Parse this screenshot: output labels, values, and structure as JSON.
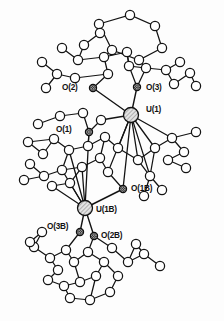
{
  "figure": {
    "kind": "crystal-structure-diagram",
    "style": "ball-and-stick ORTEP thermal ellipsoid plot",
    "background_color": "#fdfdfd",
    "bond_color": "#111111",
    "carbon_atom_fill": "#ffffff",
    "oxygen_atom_fill": "#3a3a3a",
    "metal_atom_fill": "#d9d9d9"
  },
  "labels": [
    {
      "id": "o2",
      "text": "O(2)",
      "x": 62,
      "y": 84,
      "atom_x": 93,
      "atom_y": 88
    },
    {
      "id": "o3",
      "text": "O(3)",
      "x": 146,
      "y": 84,
      "atom_x": 137,
      "atom_y": 87
    },
    {
      "id": "u1",
      "text": "U(1)",
      "x": 146,
      "y": 106,
      "atom_x": 131,
      "atom_y": 115
    },
    {
      "id": "o1",
      "text": "O(1)",
      "x": 56,
      "y": 126,
      "atom_x": 89,
      "atom_y": 132
    },
    {
      "id": "o1b",
      "text": "O(1B)",
      "x": 131,
      "y": 185,
      "atom_x": 123,
      "atom_y": 189
    },
    {
      "id": "u1b",
      "text": "U(1B)",
      "x": 96,
      "y": 206,
      "atom_x": 85,
      "atom_y": 208
    },
    {
      "id": "o3b",
      "text": "O(3B)",
      "x": 47,
      "y": 223,
      "atom_x": 80,
      "atom_y": 232
    },
    {
      "id": "o2b",
      "text": "O(2B)",
      "x": 101,
      "y": 232,
      "atom_x": 94,
      "atom_y": 236
    }
  ],
  "atoms": {
    "metal": [
      {
        "name": "U(1)",
        "x": 131,
        "y": 115,
        "r": 7.5
      },
      {
        "name": "U(1B)",
        "x": 85,
        "y": 208,
        "r": 7.5
      }
    ],
    "oxygen_labeled": [
      {
        "name": "O(2)",
        "x": 93,
        "y": 88,
        "r": 3.6
      },
      {
        "name": "O(3)",
        "x": 137,
        "y": 87,
        "r": 3.6
      },
      {
        "name": "O(1)",
        "x": 89,
        "y": 132,
        "r": 3.6
      },
      {
        "name": "O(1B)",
        "x": 123,
        "y": 189,
        "r": 3.6
      },
      {
        "name": "O(3B)",
        "x": 80,
        "y": 232,
        "r": 3.6
      },
      {
        "name": "O(2B)",
        "x": 94,
        "y": 236,
        "r": 3.6
      }
    ],
    "light": [
      {
        "x": 99,
        "y": 24,
        "r": 4.6
      },
      {
        "x": 130,
        "y": 15,
        "r": 4.6
      },
      {
        "x": 155,
        "y": 26,
        "r": 4.6
      },
      {
        "x": 162,
        "y": 48,
        "r": 4.6
      },
      {
        "x": 139,
        "y": 60,
        "r": 4.6
      },
      {
        "x": 112,
        "y": 50,
        "r": 4.6
      },
      {
        "x": 84,
        "y": 45,
        "r": 4.6
      },
      {
        "x": 100,
        "y": 33,
        "r": 4.6
      },
      {
        "x": 78,
        "y": 60,
        "r": 4.6
      },
      {
        "x": 62,
        "y": 48,
        "r": 4.6
      },
      {
        "x": 104,
        "y": 57,
        "r": 4.6
      },
      {
        "x": 127,
        "y": 52,
        "r": 4.6
      },
      {
        "x": 146,
        "y": 68,
        "r": 4.6
      },
      {
        "x": 166,
        "y": 70,
        "r": 4.6
      },
      {
        "x": 180,
        "y": 62,
        "r": 4.6
      },
      {
        "x": 190,
        "y": 73,
        "r": 4.6
      },
      {
        "x": 174,
        "y": 84,
        "r": 4.6
      },
      {
        "x": 196,
        "y": 86,
        "r": 4.6
      },
      {
        "x": 57,
        "y": 74,
        "r": 4.6
      },
      {
        "x": 42,
        "y": 62,
        "r": 4.6
      },
      {
        "x": 46,
        "y": 88,
        "r": 4.6
      },
      {
        "x": 75,
        "y": 78,
        "r": 4.6
      },
      {
        "x": 108,
        "y": 74,
        "r": 4.6
      },
      {
        "x": 129,
        "y": 66,
        "r": 4.6
      },
      {
        "x": 101,
        "y": 120,
        "r": 4.6
      },
      {
        "x": 83,
        "y": 113,
        "r": 4.6
      },
      {
        "x": 60,
        "y": 116,
        "r": 4.6
      },
      {
        "x": 38,
        "y": 124,
        "r": 4.6
      },
      {
        "x": 28,
        "y": 142,
        "r": 4.6
      },
      {
        "x": 43,
        "y": 154,
        "r": 4.6
      },
      {
        "x": 54,
        "y": 139,
        "r": 4.6
      },
      {
        "x": 69,
        "y": 150,
        "r": 4.6
      },
      {
        "x": 88,
        "y": 146,
        "r": 4.6
      },
      {
        "x": 105,
        "y": 137,
        "r": 4.6
      },
      {
        "x": 118,
        "y": 148,
        "r": 4.6
      },
      {
        "x": 100,
        "y": 158,
        "r": 4.6
      },
      {
        "x": 82,
        "y": 167,
        "r": 4.6
      },
      {
        "x": 62,
        "y": 170,
        "r": 4.6
      },
      {
        "x": 44,
        "y": 176,
        "r": 4.6
      },
      {
        "x": 30,
        "y": 164,
        "r": 4.6
      },
      {
        "x": 24,
        "y": 180,
        "r": 4.6
      },
      {
        "x": 52,
        "y": 186,
        "r": 4.6
      },
      {
        "x": 70,
        "y": 183,
        "r": 4.6
      },
      {
        "x": 108,
        "y": 172,
        "r": 4.6
      },
      {
        "x": 138,
        "y": 160,
        "r": 4.6
      },
      {
        "x": 155,
        "y": 148,
        "r": 4.6
      },
      {
        "x": 172,
        "y": 138,
        "r": 4.6
      },
      {
        "x": 184,
        "y": 152,
        "r": 4.6
      },
      {
        "x": 168,
        "y": 160,
        "r": 4.6
      },
      {
        "x": 186,
        "y": 168,
        "r": 4.6
      },
      {
        "x": 196,
        "y": 132,
        "r": 4.6
      },
      {
        "x": 150,
        "y": 176,
        "r": 4.6
      },
      {
        "x": 162,
        "y": 190,
        "r": 4.6
      },
      {
        "x": 144,
        "y": 196,
        "r": 4.6
      },
      {
        "x": 66,
        "y": 250,
        "r": 4.6
      },
      {
        "x": 50,
        "y": 258,
        "r": 4.6
      },
      {
        "x": 34,
        "y": 247,
        "r": 4.6
      },
      {
        "x": 58,
        "y": 270,
        "r": 4.6
      },
      {
        "x": 74,
        "y": 262,
        "r": 4.6
      },
      {
        "x": 88,
        "y": 252,
        "r": 4.6
      },
      {
        "x": 104,
        "y": 262,
        "r": 4.6
      },
      {
        "x": 96,
        "y": 276,
        "r": 4.6
      },
      {
        "x": 80,
        "y": 282,
        "r": 4.6
      },
      {
        "x": 64,
        "y": 286,
        "r": 4.6
      },
      {
        "x": 48,
        "y": 280,
        "r": 4.6
      },
      {
        "x": 70,
        "y": 298,
        "r": 4.6
      },
      {
        "x": 90,
        "y": 300,
        "r": 4.6
      },
      {
        "x": 110,
        "y": 292,
        "r": 4.6
      },
      {
        "x": 118,
        "y": 276,
        "r": 4.6
      },
      {
        "x": 128,
        "y": 262,
        "r": 4.6
      },
      {
        "x": 144,
        "y": 254,
        "r": 4.6
      },
      {
        "x": 160,
        "y": 266,
        "r": 4.6
      },
      {
        "x": 136,
        "y": 244,
        "r": 4.6
      },
      {
        "x": 112,
        "y": 248,
        "r": 4.6
      },
      {
        "x": 42,
        "y": 232,
        "r": 4.6
      },
      {
        "x": 30,
        "y": 242,
        "r": 4.6
      }
    ]
  },
  "caption": {
    "visible_text": ""
  }
}
